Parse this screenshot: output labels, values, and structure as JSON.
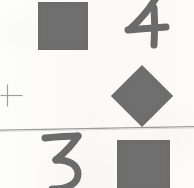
{
  "sheet": {
    "title": "Scanned shapes and numerals worksheet fragment",
    "width": 194,
    "height": 188,
    "background_color": "#fbfbfa",
    "ink_color": "#6b6b6b",
    "shape_fill_color": "#6f6f6f",
    "rule_color": "#9a9a9a"
  },
  "divider": {
    "name": "horizontal-rule",
    "description": "faint slightly slanted horizontal line",
    "left_y": 126,
    "right_y": 123
  },
  "items": [
    {
      "id": "top-left-square",
      "kind": "square",
      "label": "square",
      "quadrant": "top-left",
      "x": 38,
      "y": 2,
      "width": 50,
      "height": 48,
      "color": "#6f6f6f"
    },
    {
      "id": "numeral-four",
      "kind": "numeral",
      "label": "4",
      "quadrant": "top-right",
      "x": 122,
      "y": 0,
      "width": 43,
      "height": 45,
      "color": "#6b6b6b"
    },
    {
      "id": "crosshair-mark",
      "kind": "plus",
      "label": "+",
      "quadrant": "middle-left",
      "x": 7,
      "y": 95,
      "width": 21,
      "height": 21,
      "color": "#9e9e9e"
    },
    {
      "id": "diamond-shape",
      "kind": "diamond",
      "label": "diamond",
      "quadrant": "middle-right",
      "x": 142,
      "y": 96,
      "width": 44,
      "height": 44,
      "color": "#6f6f6f"
    },
    {
      "id": "numeral-three",
      "kind": "numeral",
      "label": "3",
      "quadrant": "bottom-left",
      "x": 44,
      "y": 135,
      "width": 36,
      "height": 53,
      "color": "#6b6b6b"
    },
    {
      "id": "bottom-right-square",
      "kind": "square",
      "label": "square",
      "quadrant": "bottom-right",
      "x": 117,
      "y": 140,
      "width": 53,
      "height": 48,
      "color": "#6f6f6f"
    }
  ]
}
